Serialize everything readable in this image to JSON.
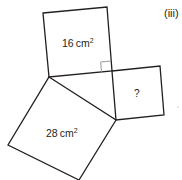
{
  "part_label": "(iii)",
  "squares": {
    "top": {
      "label": "16 cm",
      "sup": "2"
    },
    "right": {
      "label": "?"
    },
    "bottom": {
      "label": "28 cm",
      "sup": "2"
    }
  },
  "colors": {
    "stroke": "#231f20",
    "marker": "#9a9a9a",
    "background": "#ffffff"
  }
}
